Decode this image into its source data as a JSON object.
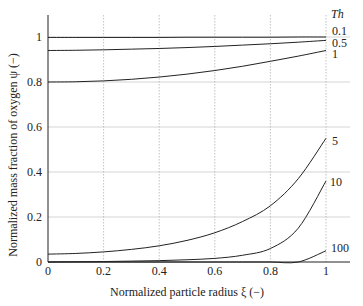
{
  "chart_data": {
    "type": "line",
    "title": "",
    "xlabel": "Normalized particle radius ξ (−)",
    "ylabel": "Normalized mass fraction of oxygen ψ (−)",
    "xlim": [
      0,
      1
    ],
    "ylim": [
      0,
      1.1
    ],
    "x_ticks": [
      0,
      0.2,
      0.4,
      0.6,
      0.8,
      1
    ],
    "x_tick_labels": [
      "0",
      "0.2",
      "0.4",
      "0.6",
      "0.8",
      "1"
    ],
    "y_ticks": [
      0,
      0.2,
      0.4,
      0.6,
      0.8,
      1
    ],
    "y_tick_labels": [
      "0",
      "0.2",
      "0.4",
      "0.6",
      "0.8",
      "1"
    ],
    "grid": true,
    "legend_title": "Th",
    "x": [
      0,
      0.1,
      0.2,
      0.3,
      0.4,
      0.5,
      0.6,
      0.7,
      0.8,
      0.9,
      1.0
    ],
    "series": [
      {
        "name": "0.1",
        "values": [
          0.998,
          0.998,
          0.998,
          0.998,
          0.998,
          0.999,
          0.999,
          0.999,
          0.999,
          1.0,
          1.0
        ]
      },
      {
        "name": "0.5",
        "values": [
          0.94,
          0.941,
          0.943,
          0.946,
          0.949,
          0.953,
          0.958,
          0.964,
          0.97,
          0.977,
          0.985
        ]
      },
      {
        "name": "1",
        "values": [
          0.8,
          0.801,
          0.805,
          0.812,
          0.822,
          0.835,
          0.851,
          0.87,
          0.892,
          0.915,
          0.94
        ]
      },
      {
        "name": "5",
        "values": [
          0.035,
          0.038,
          0.045,
          0.056,
          0.072,
          0.096,
          0.13,
          0.18,
          0.25,
          0.37,
          0.55
        ]
      },
      {
        "name": "10",
        "values": [
          0.0,
          0.001,
          0.002,
          0.004,
          0.006,
          0.01,
          0.016,
          0.03,
          0.06,
          0.15,
          0.36
        ]
      },
      {
        "name": "100",
        "values": [
          0.0,
          0.0,
          0.0,
          0.0,
          0.0,
          0.0,
          0.0,
          0.0,
          0.0,
          0.0,
          0.05
        ]
      }
    ]
  }
}
